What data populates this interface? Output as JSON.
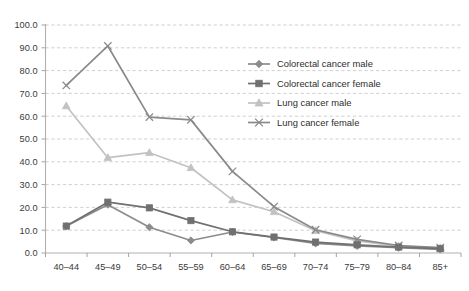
{
  "chart_data": {
    "type": "line",
    "title": "",
    "subtitle": "",
    "xlabel": "",
    "ylabel": "",
    "categories": [
      "40–44",
      "45–49",
      "50–54",
      "55–59",
      "60–64",
      "65–69",
      "70–74",
      "75–79",
      "80–84",
      "85+"
    ],
    "ylim": [
      0.0,
      100.0
    ],
    "ytick_labels": [
      "0.0",
      "10.0",
      "20.0",
      "30.0",
      "40.0",
      "50.0",
      "60.0",
      "70.0",
      "80.0",
      "90.0",
      "100.0"
    ],
    "ytick_values": [
      0,
      10,
      20,
      30,
      40,
      50,
      60,
      70,
      80,
      90,
      100
    ],
    "grid": "horizontal-dashed",
    "legend_position": "inside-top-right",
    "series": [
      {
        "name": "Colorectal cancer male",
        "marker": "diamond",
        "color": "#8c8c8c",
        "values": [
          11.8,
          21.2,
          11.3,
          5.5,
          9.2,
          6.8,
          4.2,
          3.1,
          2.3,
          1.6
        ]
      },
      {
        "name": "Colorectal cancer female",
        "marker": "square",
        "color": "#707070",
        "values": [
          11.8,
          22.3,
          19.8,
          14.2,
          9.3,
          7.0,
          4.8,
          3.6,
          2.6,
          1.9
        ]
      },
      {
        "name": "Lung cancer male",
        "marker": "triangle",
        "color": "#c2c2c2",
        "values": [
          64.5,
          41.8,
          44.0,
          37.4,
          23.3,
          18.1,
          9.8,
          5.3,
          3.0,
          2.2
        ]
      },
      {
        "name": "Lung cancer female",
        "marker": "x",
        "color": "#8a8a8a",
        "values": [
          73.5,
          90.8,
          59.6,
          58.4,
          35.8,
          20.3,
          10.2,
          6.0,
          3.3,
          2.4
        ]
      }
    ]
  },
  "legend": {
    "items": [
      {
        "label": "Colorectal cancer male"
      },
      {
        "label": "Colorectal cancer female"
      },
      {
        "label": "Lung cancer male"
      },
      {
        "label": "Lung cancer female"
      }
    ]
  },
  "axes": {
    "y_axis_name": "y-axis",
    "x_axis_name": "x-axis"
  }
}
